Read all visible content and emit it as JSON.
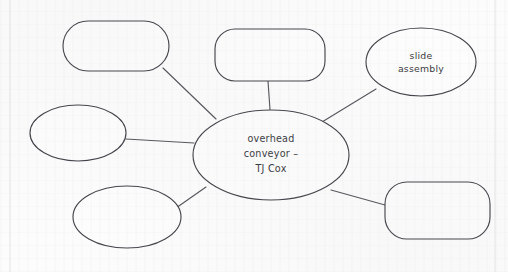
{
  "document": {
    "type": "hand-drawn-mind-map",
    "title": "overhead conveyor mind map",
    "background_color": "#fcfcfc",
    "line_color": "#44444b",
    "text_color": "#3a3a40"
  },
  "diagram": {
    "central_node": {
      "id": "central",
      "shape": "ellipse",
      "label_lines": [
        "overhead",
        "conveyor –",
        "TJ Cox"
      ],
      "label_line_1": "overhead",
      "label_line_2": "conveyor –",
      "label_line_3": "TJ Cox",
      "cx": 271,
      "cy": 155,
      "rx": 78,
      "ry": 45
    },
    "nodes": [
      {
        "id": "node-top-left",
        "shape": "rounded-rect",
        "label": "",
        "x": 63,
        "y": 21,
        "width": 106,
        "height": 50,
        "rx": 25
      },
      {
        "id": "node-top-center",
        "shape": "rounded-rect",
        "label": "",
        "x": 215,
        "y": 29,
        "width": 110,
        "height": 52,
        "rx": 20
      },
      {
        "id": "node-slide-assembly",
        "shape": "ellipse",
        "label": "slide assembly",
        "label_line_1": "slide",
        "label_line_2": "assembly",
        "cx": 421,
        "cy": 62,
        "rx": 55,
        "ry": 34
      },
      {
        "id": "node-left",
        "shape": "ellipse",
        "label": "",
        "cx": 78,
        "cy": 133,
        "rx": 48,
        "ry": 28
      },
      {
        "id": "node-bottom-left",
        "shape": "ellipse",
        "label": "",
        "cx": 127,
        "cy": 217,
        "rx": 54,
        "ry": 31
      },
      {
        "id": "node-bottom-right",
        "shape": "rounded-rect",
        "label": "",
        "x": 385,
        "y": 182,
        "width": 105,
        "height": 57,
        "rx": 22
      }
    ],
    "edges": [
      {
        "from": "node-top-left",
        "to": "central",
        "x1": 163,
        "y1": 68,
        "x2": 216,
        "y2": 119
      },
      {
        "from": "node-top-center",
        "to": "central",
        "x1": 268,
        "y1": 81,
        "x2": 270,
        "y2": 110
      },
      {
        "from": "node-slide-assembly",
        "to": "central",
        "x1": 376,
        "y1": 89,
        "x2": 322,
        "y2": 122
      },
      {
        "from": "node-left",
        "to": "central",
        "x1": 126,
        "y1": 139,
        "x2": 194,
        "y2": 143
      },
      {
        "from": "node-bottom-left",
        "to": "central",
        "x1": 176,
        "y1": 208,
        "x2": 206,
        "y2": 187
      },
      {
        "from": "node-bottom-right",
        "to": "central",
        "x1": 385,
        "y1": 205,
        "x2": 331,
        "y2": 190
      }
    ]
  }
}
